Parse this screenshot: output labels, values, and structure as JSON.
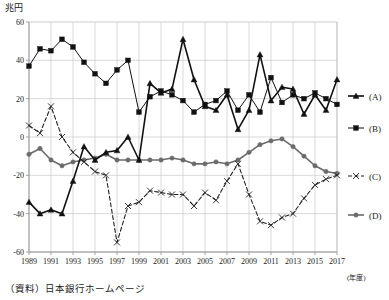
{
  "unit_label": "兆円",
  "source_note": "（資料）日本銀行ホームページ",
  "xaxis_note": "(年度)",
  "chart_data": {
    "type": "line",
    "title": "",
    "xlabel": "(年度)",
    "ylabel": "兆円",
    "ylim": [
      -60,
      60
    ],
    "yticks": [
      60,
      40,
      20,
      0,
      -20,
      -40,
      -60
    ],
    "grid": true,
    "legend_position": "right",
    "x": [
      1989,
      1990,
      1991,
      1992,
      1993,
      1994,
      1995,
      1996,
      1997,
      1998,
      1999,
      2000,
      2001,
      2002,
      2003,
      2004,
      2005,
      2006,
      2007,
      2008,
      2009,
      2010,
      2011,
      2012,
      2013,
      2014,
      2015,
      2016,
      2017
    ],
    "xticks": [
      1989,
      1991,
      1993,
      1995,
      1997,
      1999,
      2001,
      2003,
      2005,
      2007,
      2009,
      2011,
      2013,
      2015,
      2017
    ],
    "xtick_labels": [
      "1989",
      "1991",
      "1993",
      "1995",
      "1997",
      "1999",
      "2001",
      "2003",
      "2005",
      "2007",
      "2009",
      "2011",
      "2013",
      "2015",
      "2017"
    ],
    "series": [
      {
        "name": "(A)",
        "marker": "triangle",
        "dash": false,
        "color": "#111111",
        "width": 1.6,
        "values": [
          -34,
          -40,
          -38,
          -40,
          -23,
          -5,
          -12,
          -8,
          -7,
          0,
          -12,
          28,
          23,
          25,
          51,
          30,
          16,
          14,
          22,
          4,
          14,
          43,
          19,
          26,
          25,
          12,
          22,
          14,
          30
        ]
      },
      {
        "name": "(B)",
        "marker": "square",
        "dash": false,
        "color": "#111111",
        "width": 1.0,
        "values": [
          37,
          46,
          45,
          51,
          47,
          39,
          33,
          28,
          35,
          40,
          13,
          21,
          24,
          22,
          19,
          13,
          17,
          19,
          24,
          14,
          22,
          13,
          31,
          18,
          22,
          20,
          23,
          20,
          17
        ]
      },
      {
        "name": "(C)",
        "marker": "x",
        "dash": true,
        "color": "#222222",
        "width": 1.1,
        "values": [
          6,
          2,
          16,
          0,
          -8,
          -13,
          -18,
          -20,
          -55,
          -36,
          -34,
          -28,
          -29,
          -30,
          -30,
          -36,
          -29,
          -33,
          -23,
          -14,
          -30,
          -44,
          -46,
          -42,
          -40,
          -32,
          -25,
          -22,
          -20
        ]
      },
      {
        "name": "(D)",
        "marker": "circle",
        "dash": false,
        "color": "#6b6b6b",
        "width": 1.6,
        "values": [
          -9,
          -6,
          -12,
          -15,
          -13,
          -12,
          -11,
          -9,
          -12,
          -12,
          -12,
          -12,
          -12,
          -11,
          -12,
          -14,
          -14,
          -13,
          -14,
          -12,
          -8,
          -4,
          -2,
          -1,
          -5,
          -10,
          -15,
          -18,
          -19
        ]
      }
    ],
    "legend": [
      "(A)",
      "(B)",
      "(C)",
      "(D)"
    ]
  }
}
